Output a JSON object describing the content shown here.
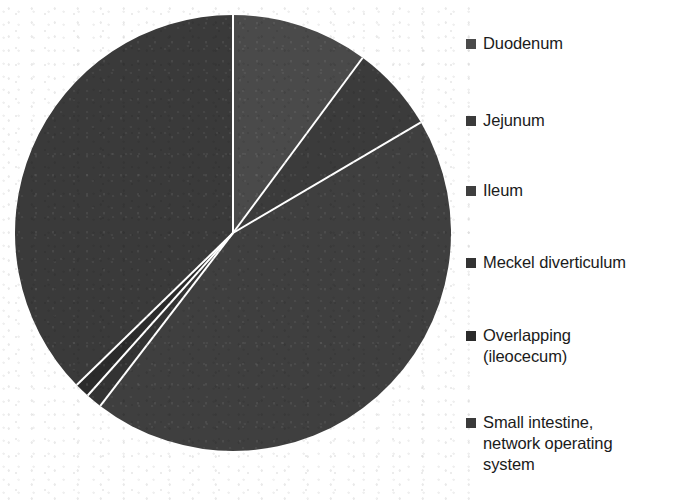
{
  "chart_data": {
    "type": "pie",
    "title": "",
    "xlabel": "",
    "ylabel": "",
    "legend_position": "right",
    "grid": false,
    "start_angle_deg": 0,
    "direction": "clockwise",
    "categories": [
      "Duodenum",
      "Jejunum",
      "Ileum",
      "Meckel diverticulum",
      "Overlapping (ileocecum)",
      "Small intestine, network operating system"
    ],
    "values": [
      10.1,
      6.4,
      43.9,
      1.2,
      1.1,
      37.3
    ],
    "units": "percent",
    "slices": [
      {
        "label": "Duodenum",
        "value": 10.1,
        "start_deg": 0.0,
        "end_deg": 36.5,
        "color": "#4a4a4a"
      },
      {
        "label": "Jejunum",
        "value": 6.4,
        "start_deg": 36.5,
        "end_deg": 59.5,
        "color": "#3b3b3b"
      },
      {
        "label": "Ileum",
        "value": 43.9,
        "start_deg": 59.5,
        "end_deg": 217.5,
        "color": "#3f3f3f"
      },
      {
        "label": "Meckel diverticulum",
        "value": 1.2,
        "start_deg": 217.5,
        "end_deg": 221.8,
        "color": "#333333"
      },
      {
        "label": "Overlapping (ileocecum)",
        "value": 1.1,
        "start_deg": 221.8,
        "end_deg": 225.8,
        "color": "#2b2b2b"
      },
      {
        "label": "Small intestine, network operating system",
        "value": 37.3,
        "start_deg": 225.8,
        "end_deg": 360.0,
        "color": "#3a3a3a"
      }
    ],
    "geometry": {
      "center_x": 233,
      "center_y": 233,
      "radius": 218,
      "separator_color": "#ffffff",
      "separator_width": 2
    }
  },
  "legend": {
    "items": [
      {
        "label": "Duodenum",
        "color": "#4a4a4a",
        "top": 33
      },
      {
        "label": "Jejunum",
        "color": "#3b3b3b",
        "top": 110
      },
      {
        "label": "Ileum",
        "color": "#3f3f3f",
        "top": 180
      },
      {
        "label": "Meckel diverticulum",
        "color": "#333333",
        "top": 252
      },
      {
        "label": "Overlapping\n(ileocecum)",
        "color": "#2b2b2b",
        "top": 325
      },
      {
        "label": "Small intestine,\nnetwork operating\nsystem",
        "color": "#3a3a3a",
        "top": 412
      }
    ]
  },
  "artifacts": {
    "ghost_text_top": "",
    "ghost_text_bottom": ""
  }
}
